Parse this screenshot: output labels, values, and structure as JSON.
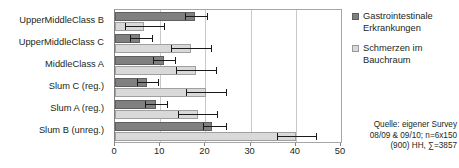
{
  "chart_data": {
    "type": "bar",
    "orientation": "horizontal",
    "title": "",
    "xlabel": "",
    "ylabel": "",
    "xlim": [
      0,
      50
    ],
    "xticks": [
      0,
      10,
      20,
      30,
      40,
      50
    ],
    "xtick_labels": [
      "0",
      "10",
      "20",
      "30",
      "40",
      "50"
    ],
    "grid": true,
    "grid_axis": "x",
    "legend_position": "right",
    "categories": [
      "UpperMiddleClass B",
      "UpperMiddleClass C",
      "MiddleClass A",
      "Slum C (reg.)",
      "Slum A (reg.)",
      "Slum B (unreg.)"
    ],
    "series": [
      {
        "name": "Gastrointestinale Erkrankungen",
        "color": "#808080",
        "values": [
          17.8,
          5.6,
          10.8,
          7.0,
          9.0,
          21.5
        ],
        "error_low": [
          15.4,
          3.4,
          8.4,
          4.8,
          6.6,
          19.4
        ],
        "error_high": [
          20.6,
          8.3,
          13.4,
          9.7,
          11.8,
          24.7
        ]
      },
      {
        "name": "Schmerzen im Bauchraum",
        "color": "#d9d9d9",
        "values": [
          6.5,
          16.9,
          18.0,
          20.2,
          18.4,
          40.0
        ],
        "error_low": [
          2.3,
          12.3,
          13.6,
          15.6,
          13.9,
          35.8
        ],
        "error_high": [
          11.0,
          21.4,
          22.5,
          24.8,
          22.8,
          44.8
        ]
      }
    ]
  },
  "legend": {
    "items": [
      {
        "label_line1": "Gastrointestinale",
        "label_line2": "Erkrankungen",
        "swatch": "dark"
      },
      {
        "label_line1": "Schmerzen im",
        "label_line2": "Bauchraum",
        "swatch": "light"
      }
    ]
  },
  "source_note": {
    "line1": "Quelle: eigener Survey",
    "line2": "08/09 & 09/10; n=6x150",
    "line3": "(900) HH, ∑=3857"
  }
}
